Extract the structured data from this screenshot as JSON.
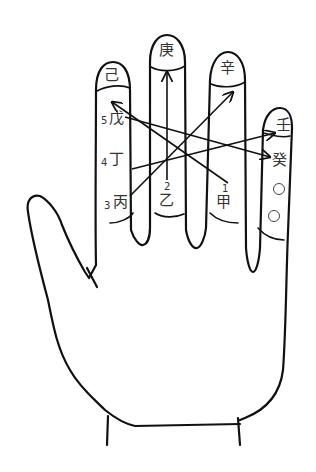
{
  "diagram": {
    "type": "hand-diagram",
    "fingertip_labels": {
      "index": "己",
      "middle": "庚",
      "ring": "辛",
      "pinky": "壬"
    },
    "numbered_stems": [
      {
        "number": "5",
        "stem": "戊"
      },
      {
        "number": "4",
        "stem": "丁"
      },
      {
        "number": "3",
        "stem": "丙"
      },
      {
        "number": "2",
        "stem": "乙"
      },
      {
        "number": "1",
        "stem": "甲"
      }
    ],
    "pinky_extra": {
      "stem": "癸",
      "marks": [
        "○",
        "○"
      ]
    },
    "arrows": [
      {
        "from": "1 甲",
        "to": "己"
      },
      {
        "from": "2 乙",
        "to": "庚"
      },
      {
        "from": "3 丙",
        "to": "辛"
      },
      {
        "from": "4 丁",
        "to": "壬"
      },
      {
        "from": "5 戊",
        "to": "癸"
      }
    ]
  }
}
